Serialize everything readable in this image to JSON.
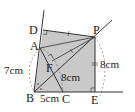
{
  "diagram": {
    "points": {
      "A": {
        "label": "A",
        "x": 40,
        "y": 48
      },
      "B": {
        "label": "B",
        "x": 34,
        "y": 92
      },
      "C": {
        "label": "C",
        "x": 63,
        "y": 92
      },
      "D": {
        "label": "D",
        "x": 43,
        "y": 30
      },
      "E": {
        "label": "E",
        "x": 95,
        "y": 92
      },
      "F": {
        "label": "F",
        "x": 50,
        "y": 65
      },
      "P": {
        "label": "P",
        "x": 95,
        "y": 37
      }
    },
    "measurements": {
      "AB": "7cm",
      "BC": "5cm",
      "AC": "8cm",
      "PE": "8cm"
    },
    "colors": {
      "fill": "#c9c9c9",
      "line": "#333333",
      "dashed": "#777777"
    }
  }
}
